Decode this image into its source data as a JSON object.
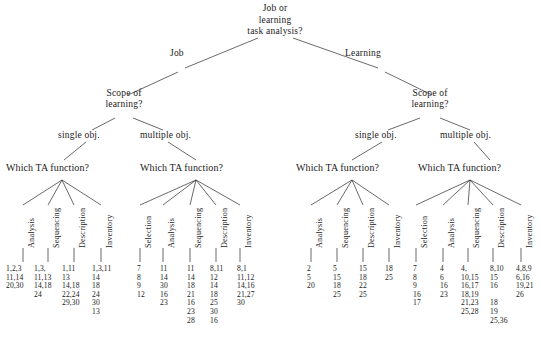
{
  "diagram": {
    "title_node": "Job or learning task analysis?",
    "root": {
      "label_line1": "Job or",
      "label_line2": "learning",
      "label_line3": "task analysis?"
    },
    "top_branches": [
      {
        "label": "Job"
      },
      {
        "label": "Learning"
      }
    ],
    "scope_nodes": [
      {
        "line1": "Scope of",
        "line2": "learning?"
      },
      {
        "line1": "Scope of",
        "line2": "learning?"
      }
    ],
    "scope_branches": [
      {
        "label": "single obj."
      },
      {
        "label": "multiple obj."
      },
      {
        "label": "single obj."
      },
      {
        "label": "multiple obj."
      }
    ],
    "ta_question": "Which TA function?",
    "groups": [
      {
        "id": "job-single-obj",
        "question": "Which TA function?",
        "functions": [
          {
            "name": "Analysis",
            "values": [
              "1,2,3",
              "11,14",
              "20,30"
            ]
          },
          {
            "name": "Sequencing",
            "values": [
              "1,3,",
              "11,13",
              "14,18",
              "24"
            ]
          },
          {
            "name": "Description",
            "values": [
              "1,11",
              "13",
              "14,18",
              "22,24",
              "29,30",
              "13"
            ]
          },
          {
            "name": "Inventory",
            "values": [
              "1,3,11",
              "14",
              "18",
              "24",
              "30"
            ]
          }
        ]
      },
      {
        "id": "job-multiple-obj",
        "question": "Which TA function?",
        "functions": [
          {
            "name": "Selection",
            "values": [
              "7",
              "8",
              "9",
              "12"
            ]
          },
          {
            "name": "Analysis",
            "values": [
              "11",
              "14",
              "30",
              "16",
              "23"
            ]
          },
          {
            "name": "Sequencing",
            "values": [
              "11",
              "14",
              "18",
              "21",
              "16",
              "23",
              "28"
            ]
          },
          {
            "name": "Description",
            "values": [
              "8,11",
              "12",
              "14",
              "18",
              "25",
              "30",
              "16"
            ]
          },
          {
            "name": "Inventory",
            "values": [
              "8,1",
              "11,12",
              "14,16",
              "21,27",
              "30"
            ]
          }
        ]
      },
      {
        "id": "learning-single-obj",
        "question": "Which TA function?",
        "functions": [
          {
            "name": "Analysis",
            "values": [
              "2",
              "5",
              "20"
            ]
          },
          {
            "name": "Sequencing",
            "values": [
              "5",
              "15",
              "18",
              "25"
            ]
          },
          {
            "name": "Description",
            "values": [
              "15",
              "18",
              "22",
              "25"
            ]
          },
          {
            "name": "Inventory",
            "values": [
              "18",
              "25"
            ]
          }
        ]
      },
      {
        "id": "learning-multiple-obj",
        "question": "Which TA function?",
        "functions": [
          {
            "name": "Selection",
            "values": [
              "7",
              "8",
              "9",
              "16",
              "17"
            ]
          },
          {
            "name": "Analysis",
            "values": [
              "4",
              "6",
              "16",
              "23"
            ]
          },
          {
            "name": "Sequencing",
            "values": [
              "4,",
              "10,15",
              "16,17",
              "18,19",
              "21,23",
              "25,28"
            ]
          },
          {
            "name": "Description",
            "values": [
              "8,10",
              "15",
              "16",
              "",
              "18",
              "19",
              "25,36"
            ]
          },
          {
            "name": "Inventory",
            "values": [
              "4,8,9",
              "6,16",
              "19,21",
              "26"
            ]
          }
        ]
      }
    ]
  }
}
